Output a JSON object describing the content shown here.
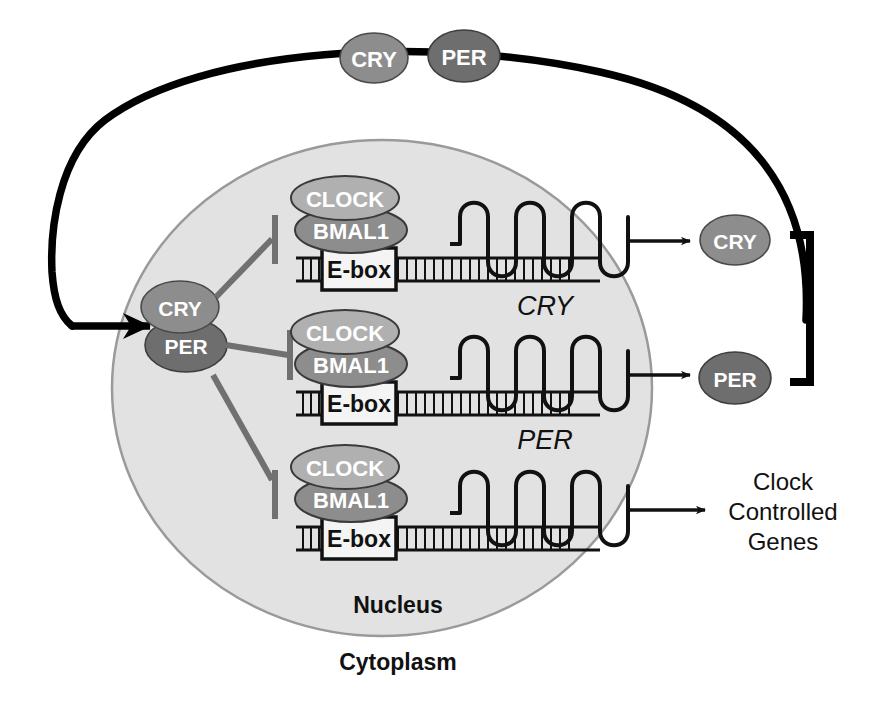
{
  "figure": {
    "domain_kind": "diagram"
  },
  "colors": {
    "background": "#ffffff",
    "nucleus_fill": "#e2e2e2",
    "nucleus_stroke": "#9a9a9a",
    "membrane_stroke": "#000000",
    "cry_fill": "#8d8d8d",
    "per_fill": "#6e6e6e",
    "clock_fill": "#b0b0b0",
    "bmal1_fill": "#8d8d8d",
    "protein_stroke": "#3a3a3a",
    "ebox_fill": "#f4f4f4",
    "ebox_stroke": "#111111",
    "dna_stroke": "#111111",
    "wave_stroke": "#111111",
    "arrow_stroke": "#111111",
    "inhibit_stroke": "#707070",
    "bracket_stroke": "#000000",
    "text_dark": "#111111",
    "text_light": "#ffffff"
  },
  "regions": {
    "nucleus_label": "Nucleus",
    "cytoplasm_label": "Cytoplasm"
  },
  "membrane_complex": {
    "cry_label": "CRY",
    "per_label": "PER"
  },
  "nuclear_complex": {
    "cry_label": "CRY",
    "per_label": "PER"
  },
  "genes": [
    {
      "id": "cry-gene",
      "clock_label": "CLOCK",
      "bmal1_label": "BMAL1",
      "ebox_label": "E-box",
      "transcript_label": "CRY",
      "output_label": "CRY",
      "has_output_protein": true
    },
    {
      "id": "per-gene",
      "clock_label": "CLOCK",
      "bmal1_label": "BMAL1",
      "ebox_label": "E-box",
      "transcript_label": "PER",
      "output_label": "PER",
      "has_output_protein": true
    },
    {
      "id": "ccg-gene",
      "clock_label": "CLOCK",
      "bmal1_label": "BMAL1",
      "ebox_label": "E-box",
      "transcript_label": "",
      "output_label": "",
      "has_output_protein": false
    }
  ],
  "outputs": {
    "cry_protein_label": "CRY",
    "per_protein_label": "PER",
    "clock_controlled_genes": [
      "Clock",
      "Controlled",
      "Genes"
    ]
  },
  "icons": {
    "arrowhead": "arrowhead-icon",
    "inhibition_tbar": "inhibition-tbar-icon",
    "bracket": "bracket-icon",
    "wave": "transcript-wave-icon",
    "dna": "dna-strand-icon"
  }
}
